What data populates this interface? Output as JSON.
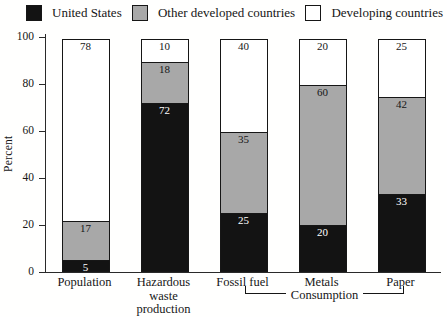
{
  "chart_data": {
    "type": "bar",
    "stacked": true,
    "title": "",
    "xlabel": "",
    "ylabel": "Percent",
    "ylim": [
      0,
      100
    ],
    "yticks": [
      0,
      20,
      40,
      60,
      80,
      100
    ],
    "grid": false,
    "legend_position": "top",
    "categories": [
      "Population",
      "Hazardous waste production",
      "Fossil fuel",
      "Metals",
      "Paper"
    ],
    "category_label_lines": [
      [
        "Population"
      ],
      [
        "Hazardous",
        "waste",
        "production"
      ],
      [
        "Fossil fuel"
      ],
      [
        "Metals"
      ],
      [
        "Paper"
      ]
    ],
    "series": [
      {
        "name": "United States",
        "color": "#131313",
        "label_color": "#ffffff",
        "values": [
          5,
          72,
          25,
          20,
          33
        ]
      },
      {
        "name": "Other developed countries",
        "color": "#a8a8a8",
        "label_color": "#161616",
        "values": [
          17,
          18,
          35,
          60,
          42
        ]
      },
      {
        "name": "Developing countries",
        "color": "#ffffff",
        "label_color": "#161616",
        "values": [
          78,
          10,
          40,
          20,
          25
        ]
      }
    ],
    "group_annotation": {
      "label": "Consumption",
      "from_category": "Fossil fuel",
      "to_category": "Paper"
    }
  },
  "colors": {
    "axis": "#2a2a2a",
    "segment_border": "#161616",
    "background": "#fffffe"
  }
}
